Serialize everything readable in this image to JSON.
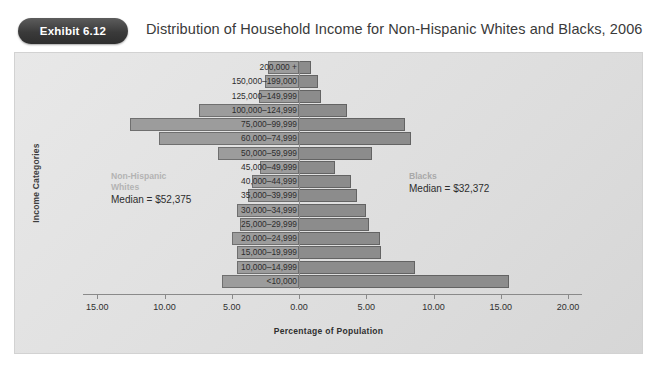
{
  "header": {
    "badge_label": "Exhibit 6.12",
    "title": "Distribution of Household Income for Non-Hispanic Whites and Blacks, 2006"
  },
  "annotations": {
    "left": {
      "group_line1": "Non-Hispanic",
      "group_line2": "Whites",
      "median": "Median = $52,375"
    },
    "right": {
      "group_line1": "Blacks",
      "group_line2": "",
      "median": "Median = $32,372"
    }
  },
  "colors": {
    "bar_left": "#9c9c9c",
    "bar_left_border": "#6f6f6f",
    "bar_right": "#8c8c8c",
    "bar_right_border": "#636363",
    "panel_bg": "#e4e4e4",
    "badge": "#3a3a3a",
    "axis": "#8a8a8a"
  },
  "chart_data": {
    "type": "bar",
    "subtype": "population-pyramid",
    "title": "Distribution of Household Income for Non-Hispanic Whites and Blacks, 2006",
    "xlabel": "Percentage of Population",
    "ylabel": "Income Categories",
    "grid": false,
    "legend_position": "inline-annotation",
    "xticks": [
      "15.00",
      "10.00",
      "5.00",
      "0.00",
      "5.00",
      "10.00",
      "15.00",
      "20.00"
    ],
    "xtick_values": [
      -15,
      -10,
      -5,
      0,
      5,
      10,
      15,
      20
    ],
    "xlim": [
      -17.0,
      20.5
    ],
    "categories": [
      "200,000 +",
      "150,000–199,000",
      "125,000–149,999",
      "100,000–124,999",
      "75,000–99,999",
      "60,000–74,999",
      "50,000–59,999",
      "45,000–49,999",
      "40,000–44,999",
      "35,000–39,999",
      "30,000–34,999",
      "25,000–29,999",
      "20,000–24,999",
      "15,000–19,999",
      "10,000–14,999",
      "<10,000"
    ],
    "series": [
      {
        "name": "Non-Hispanic Whites",
        "side": "left",
        "median": 52375,
        "values": [
          2.3,
          2.5,
          3.0,
          7.4,
          12.6,
          10.4,
          6.0,
          2.9,
          3.5,
          3.8,
          4.6,
          4.4,
          5.0,
          4.6,
          4.6,
          5.7
        ]
      },
      {
        "name": "Blacks",
        "side": "right",
        "median": 32372,
        "values": [
          0.9,
          1.4,
          1.6,
          3.6,
          7.9,
          8.3,
          5.4,
          2.7,
          3.9,
          4.3,
          5.0,
          5.2,
          6.0,
          6.1,
          8.6,
          15.6
        ]
      }
    ]
  }
}
